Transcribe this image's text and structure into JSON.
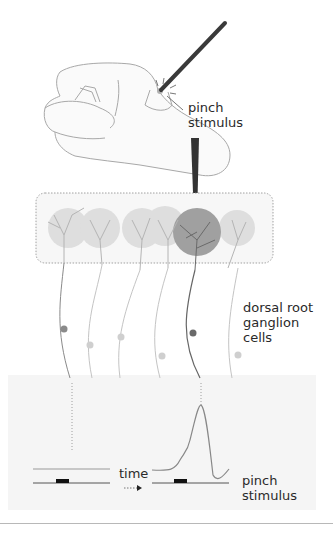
{
  "labels": {
    "pinch_top": "pinch\nstimulus",
    "dorsal": "dorsal root\nganglion\ncells",
    "time": "time",
    "pinch_bottom": "pinch\nstimulus"
  },
  "colors": {
    "hand_outline": "#9a9a9a",
    "probe": "#3a3a3a",
    "receptive_field_light": "#dcdcdc",
    "receptive_field_active": "#9a9a9a",
    "neuron_light": "#c8c8c8",
    "neuron_dark": "#6a6a6a",
    "panel_bg": "#f5f5f5",
    "trace": "#8a8a8a"
  },
  "figure": {
    "neuron_count": 6,
    "active_neuron_index": 4
  }
}
